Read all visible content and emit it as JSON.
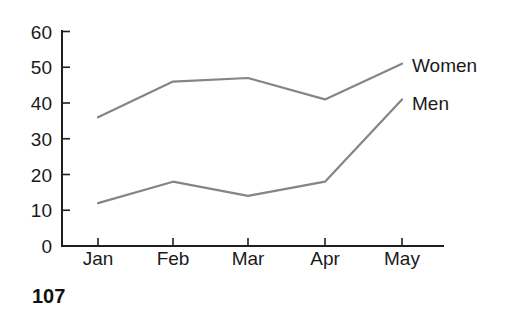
{
  "chart_data": {
    "type": "line",
    "categories": [
      "Jan",
      "Feb",
      "Mar",
      "Apr",
      "May"
    ],
    "series": [
      {
        "name": "Women",
        "values": [
          36,
          46,
          47,
          41,
          51
        ]
      },
      {
        "name": "Men",
        "values": [
          12,
          18,
          14,
          18,
          41
        ]
      }
    ],
    "yticks": [
      0,
      10,
      20,
      30,
      40,
      50,
      60
    ],
    "ylim": [
      0,
      60
    ],
    "grid": false,
    "legend_position": "labels-at-line-ends"
  },
  "caption": "107",
  "colors": {
    "axis": "#1f1f1f",
    "line": "#858585",
    "text": "#1a1a1a",
    "background": "#ffffff"
  }
}
